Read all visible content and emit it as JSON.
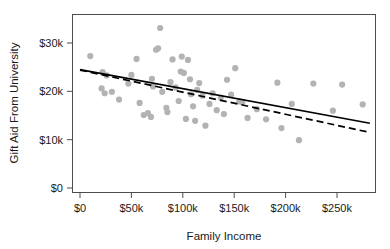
{
  "chart_data": {
    "type": "scatter",
    "title": "",
    "xlabel": "Family Income",
    "ylabel": "Gift Aid From University",
    "xlim": [
      -8000,
      287000
    ],
    "ylim": [
      -900,
      36700
    ],
    "grid": false,
    "legend": null,
    "x_ticks": [
      {
        "value": 0,
        "label": "$0"
      },
      {
        "value": 50000,
        "label": "$50k"
      },
      {
        "value": 100000,
        "label": "$100k"
      },
      {
        "value": 150000,
        "label": "$150k"
      },
      {
        "value": 200000,
        "label": "$200k"
      },
      {
        "value": 250000,
        "label": "$250k"
      }
    ],
    "y_ticks": [
      {
        "value": 0,
        "label": "$0"
      },
      {
        "value": 10000,
        "label": "$10k"
      },
      {
        "value": 20000,
        "label": "$20k"
      },
      {
        "value": 30000,
        "label": "$30k"
      }
    ],
    "point_color": "#b3b3b3",
    "point_radius": 3.1,
    "points": [
      {
        "x": 10000,
        "y": 27300
      },
      {
        "x": 22000,
        "y": 24000
      },
      {
        "x": 26000,
        "y": 23300
      },
      {
        "x": 21000,
        "y": 20600
      },
      {
        "x": 24000,
        "y": 19600
      },
      {
        "x": 31000,
        "y": 19900
      },
      {
        "x": 38000,
        "y": 18300
      },
      {
        "x": 47000,
        "y": 21600
      },
      {
        "x": 50000,
        "y": 23400
      },
      {
        "x": 55000,
        "y": 26700
      },
      {
        "x": 58000,
        "y": 17600
      },
      {
        "x": 62000,
        "y": 15100
      },
      {
        "x": 66000,
        "y": 15500
      },
      {
        "x": 69000,
        "y": 14700
      },
      {
        "x": 70000,
        "y": 22600
      },
      {
        "x": 71000,
        "y": 21000
      },
      {
        "x": 74000,
        "y": 28600
      },
      {
        "x": 76000,
        "y": 28900
      },
      {
        "x": 78000,
        "y": 33100
      },
      {
        "x": 80000,
        "y": 19900
      },
      {
        "x": 84000,
        "y": 16600
      },
      {
        "x": 85000,
        "y": 15700
      },
      {
        "x": 88000,
        "y": 21900
      },
      {
        "x": 90000,
        "y": 26600
      },
      {
        "x": 93000,
        "y": 20800
      },
      {
        "x": 96000,
        "y": 18000
      },
      {
        "x": 98000,
        "y": 24100
      },
      {
        "x": 99000,
        "y": 27200
      },
      {
        "x": 101000,
        "y": 23800
      },
      {
        "x": 103000,
        "y": 14300
      },
      {
        "x": 105000,
        "y": 26500
      },
      {
        "x": 107000,
        "y": 22500
      },
      {
        "x": 108000,
        "y": 19400
      },
      {
        "x": 110000,
        "y": 16900
      },
      {
        "x": 112000,
        "y": 13900
      },
      {
        "x": 114000,
        "y": 20300
      },
      {
        "x": 116000,
        "y": 21700
      },
      {
        "x": 119000,
        "y": 19100
      },
      {
        "x": 122000,
        "y": 12900
      },
      {
        "x": 126000,
        "y": 17400
      },
      {
        "x": 129000,
        "y": 19600
      },
      {
        "x": 133000,
        "y": 16100
      },
      {
        "x": 137000,
        "y": 18700
      },
      {
        "x": 140000,
        "y": 15300
      },
      {
        "x": 143000,
        "y": 22400
      },
      {
        "x": 147000,
        "y": 19300
      },
      {
        "x": 151000,
        "y": 24800
      },
      {
        "x": 155000,
        "y": 17900
      },
      {
        "x": 158000,
        "y": 17800
      },
      {
        "x": 163000,
        "y": 14500
      },
      {
        "x": 172000,
        "y": 16300
      },
      {
        "x": 181000,
        "y": 14200
      },
      {
        "x": 192000,
        "y": 21800
      },
      {
        "x": 196000,
        "y": 12400
      },
      {
        "x": 206000,
        "y": 17400
      },
      {
        "x": 213000,
        "y": 9900
      },
      {
        "x": 227000,
        "y": 21600
      },
      {
        "x": 246000,
        "y": 16000
      },
      {
        "x": 255000,
        "y": 21400
      },
      {
        "x": 275000,
        "y": 17300
      }
    ],
    "fit_lines": [
      {
        "name": "least-squares-line",
        "style": "solid",
        "color": "#000000",
        "x_start": 0,
        "y_start": 24500,
        "x_end": 282000,
        "y_end": 13400
      },
      {
        "name": "robust-line",
        "style": "dashed",
        "color": "#000000",
        "x_start": 0,
        "y_start": 24400,
        "x_end": 282000,
        "y_end": 11500
      }
    ]
  }
}
